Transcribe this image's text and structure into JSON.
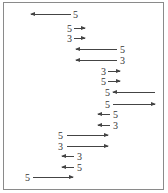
{
  "diagram": {
    "rows": [
      {
        "label": "5",
        "direction": "left",
        "label_x": 73,
        "arrow_x": 31,
        "arrow_w": 40,
        "y": 10
      },
      {
        "label": "5",
        "direction": "right",
        "label_x": 67,
        "arrow_x": 74,
        "arrow_w": 11,
        "y": 24
      },
      {
        "label": "3",
        "direction": "right",
        "label_x": 67,
        "arrow_x": 74,
        "arrow_w": 11,
        "y": 34
      },
      {
        "label": "5",
        "direction": "left",
        "label_x": 120,
        "arrow_x": 76,
        "arrow_w": 41,
        "y": 45
      },
      {
        "label": "3",
        "direction": "left",
        "label_x": 120,
        "arrow_x": 76,
        "arrow_w": 41,
        "y": 56
      },
      {
        "label": "3",
        "direction": "right",
        "label_x": 101,
        "arrow_x": 108,
        "arrow_w": 12,
        "y": 67
      },
      {
        "label": "5",
        "direction": "right",
        "label_x": 101,
        "arrow_x": 108,
        "arrow_w": 12,
        "y": 77
      },
      {
        "label": "5",
        "direction": "left",
        "label_x": 105,
        "arrow_x": 113,
        "arrow_w": 42,
        "y": 88
      },
      {
        "label": "5",
        "direction": "right",
        "label_x": 105,
        "arrow_x": 113,
        "arrow_w": 42,
        "y": 100
      },
      {
        "label": "5",
        "direction": "left",
        "label_x": 113,
        "arrow_x": 98,
        "arrow_w": 12,
        "y": 110
      },
      {
        "label": "3",
        "direction": "left",
        "label_x": 113,
        "arrow_x": 98,
        "arrow_w": 12,
        "y": 121
      },
      {
        "label": "5",
        "direction": "right",
        "label_x": 58,
        "arrow_x": 67,
        "arrow_w": 41,
        "y": 131
      },
      {
        "label": "3",
        "direction": "right",
        "label_x": 58,
        "arrow_x": 67,
        "arrow_w": 41,
        "y": 142
      },
      {
        "label": "3",
        "direction": "left",
        "label_x": 77,
        "arrow_x": 62,
        "arrow_w": 12,
        "y": 152
      },
      {
        "label": "5",
        "direction": "left",
        "label_x": 77,
        "arrow_x": 62,
        "arrow_w": 12,
        "y": 163
      },
      {
        "label": "5",
        "direction": "right",
        "label_x": 25,
        "arrow_x": 33,
        "arrow_w": 40,
        "y": 173
      }
    ]
  }
}
